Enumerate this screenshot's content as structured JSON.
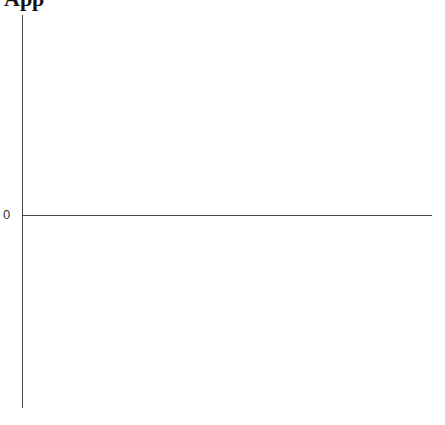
{
  "chart_data": {
    "type": "bar",
    "title": "App",
    "xlabel": "",
    "ylabel": "",
    "categories": [],
    "values": [],
    "y_ticks": [
      "0"
    ],
    "grid": false,
    "legend": null
  }
}
